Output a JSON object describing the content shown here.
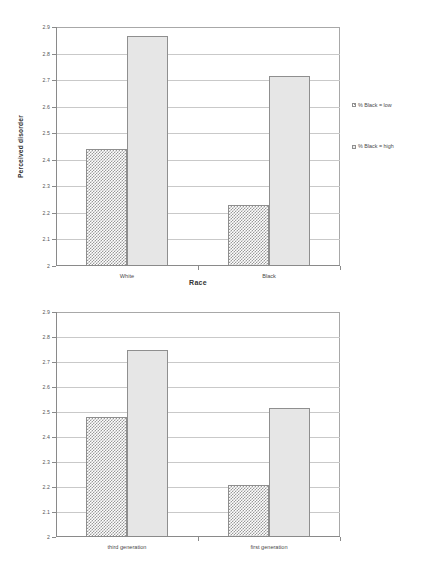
{
  "chart_data": [
    {
      "id": "top",
      "type": "bar",
      "title": "",
      "xlabel": "Race",
      "ylabel": "Perceived disorder",
      "ylim": [
        2,
        2.9
      ],
      "ytick_step": 0.1,
      "yticks": [
        "2.9",
        "2.8",
        "2.7",
        "2.6",
        "2.5",
        "2.4",
        "2.3",
        "2.2",
        "2.1",
        "2"
      ],
      "grid": true,
      "legend_position": "right",
      "categories": [
        "White",
        "Black"
      ],
      "series": [
        {
          "name": "% Black = low",
          "swatch": "low",
          "values": [
            2.44,
            2.23
          ]
        },
        {
          "name": "% Black = high",
          "swatch": "high",
          "values": [
            2.865,
            2.715
          ]
        }
      ]
    },
    {
      "id": "bottom",
      "type": "bar",
      "title": "",
      "xlabel": "",
      "ylabel": "perceived disorder",
      "ylim": [
        2,
        2.9
      ],
      "ytick_step": 0.1,
      "yticks": [
        "2.9",
        "2.8",
        "2.7",
        "2.6",
        "2.5",
        "2.4",
        "2.3",
        "2.2",
        "2.1",
        "2"
      ],
      "grid": true,
      "legend_position": "right",
      "categories": [
        "third generation",
        "first generation"
      ],
      "series": [
        {
          "name": "% latino = low",
          "swatch": "low",
          "values": [
            2.48,
            2.21
          ]
        },
        {
          "name": "% latino = high",
          "swatch": "high",
          "values": [
            2.75,
            2.515
          ]
        }
      ]
    }
  ],
  "style": {
    "bar_low_pattern_color": "#9a9a9a",
    "bar_high_fill": "#e6e6e6",
    "bar_border": "#8f8f8f",
    "gridline_color": "#c9c9c9",
    "axis_color": "#8a8a8a",
    "text_color": "#4a4a4a",
    "background": "#ffffff"
  }
}
